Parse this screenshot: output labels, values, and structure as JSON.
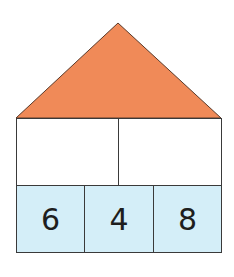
{
  "diagram": {
    "type": "number-house",
    "roof": {
      "color": "#f08a58",
      "value": ""
    },
    "middle_row": [
      {
        "value": ""
      },
      {
        "value": ""
      }
    ],
    "bottom_row": [
      {
        "value": "6"
      },
      {
        "value": "4"
      },
      {
        "value": "8"
      }
    ],
    "colors": {
      "roof": "#f08a58",
      "bottom_fill": "#d4eef8",
      "middle_fill": "#ffffff",
      "outline": "#3a3a3a"
    }
  }
}
